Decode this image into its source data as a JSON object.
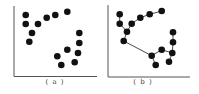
{
  "figure": {
    "colors": {
      "axis": "#555555",
      "point": "#111111",
      "edge": "#333333",
      "background": "#ffffff"
    },
    "panels": [
      {
        "label": "( a )",
        "points": [
          [
            25.7,
            15
          ],
          [
            25.7,
            24
          ],
          [
            38,
            24
          ],
          [
            46.7,
            17.7
          ],
          [
            55.3,
            15
          ],
          [
            67.3,
            11.7
          ],
          [
            32,
            33
          ],
          [
            29.3,
            41.7
          ],
          [
            79.3,
            33
          ],
          [
            79.3,
            43
          ],
          [
            78,
            53
          ],
          [
            74.7,
            62.3
          ],
          [
            67.3,
            49.7
          ],
          [
            57.3,
            56.3
          ],
          [
            61.3,
            65
          ]
        ],
        "edges": []
      },
      {
        "label": "( b )",
        "points": [
          [
            119.7,
            14.3
          ],
          [
            119.7,
            23.7
          ],
          [
            127,
            31.7
          ],
          [
            131.7,
            23.7
          ],
          [
            140.3,
            17.7
          ],
          [
            149.7,
            14.3
          ],
          [
            161.7,
            11
          ],
          [
            123.7,
            41
          ],
          [
            151.7,
            55.7
          ],
          [
            155.7,
            65
          ],
          [
            161.7,
            49.7
          ],
          [
            173,
            32.3
          ],
          [
            173,
            42.3
          ],
          [
            172.3,
            53
          ],
          [
            169,
            61.7
          ]
        ],
        "edges": [
          [
            0,
            1
          ],
          [
            1,
            2
          ],
          [
            2,
            3
          ],
          [
            3,
            4
          ],
          [
            4,
            5
          ],
          [
            5,
            6
          ],
          [
            2,
            7
          ],
          [
            7,
            8
          ],
          [
            8,
            9
          ],
          [
            8,
            10
          ],
          [
            10,
            13
          ],
          [
            13,
            12
          ],
          [
            12,
            11
          ],
          [
            13,
            14
          ]
        ]
      }
    ]
  }
}
